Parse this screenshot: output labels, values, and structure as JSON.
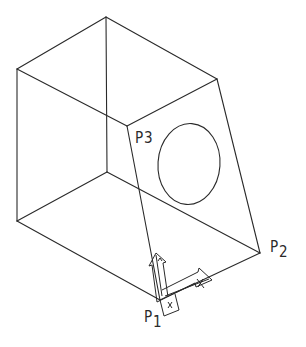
{
  "diagram": {
    "title": "",
    "stroke_color": "#2a2a2a",
    "background_color": "#ffffff",
    "vertices": {
      "top": [
        106,
        17
      ],
      "left_top": [
        17,
        69
      ],
      "right_top": [
        217,
        79
      ],
      "p3": [
        127,
        126
      ],
      "left_bottom": [
        17,
        221
      ],
      "inner_bottom": [
        107,
        172
      ],
      "p2": [
        260,
        253
      ],
      "p1": [
        160,
        300
      ]
    },
    "edges": [
      [
        "top",
        "left_top"
      ],
      [
        "top",
        "right_top"
      ],
      [
        "left_top",
        "p3"
      ],
      [
        "right_top",
        "p3"
      ],
      [
        "top",
        "inner_bottom"
      ],
      [
        "left_top",
        "left_bottom"
      ],
      [
        "left_bottom",
        "p1"
      ],
      [
        "left_bottom",
        "inner_bottom"
      ],
      [
        "inner_bottom",
        "p2"
      ],
      [
        "right_top",
        "p2"
      ],
      [
        "p3",
        "p1"
      ],
      [
        "p1",
        "p2"
      ]
    ],
    "hole": {
      "shape": "ellipse",
      "center": [
        189,
        164
      ],
      "rx": 31,
      "ry": 41
    },
    "labels": {
      "p1": {
        "letter": "P",
        "index": "1"
      },
      "p2": {
        "letter": "P",
        "index": "2"
      },
      "p3": {
        "letter": "P",
        "index": "3"
      }
    },
    "ucs_icon": {
      "origin": "P1",
      "axes": [
        "x-arrow",
        "y-arrow"
      ]
    }
  }
}
